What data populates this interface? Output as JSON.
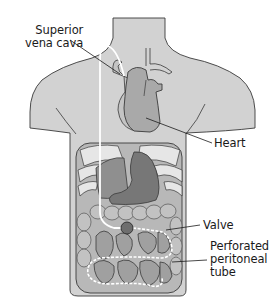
{
  "diagram": {
    "colors": {
      "skin": "#d2d2d2",
      "outline": "#3a3a3a",
      "heart": "#a9a9a9",
      "liver": "#8f8f8f",
      "stomach": "#777777",
      "colon": "#b5b5b5",
      "small_intestine": "#a0a0a0",
      "ribs": "#e6e6e6",
      "tube": "#ffffff",
      "valve": "#6e6e6e",
      "background": "#ffffff"
    },
    "labels": {
      "svc": "Superior\nvena cava",
      "heart": "Heart",
      "valve": "Valve",
      "tube": "Perforated\nperitoneal\ntube"
    }
  }
}
